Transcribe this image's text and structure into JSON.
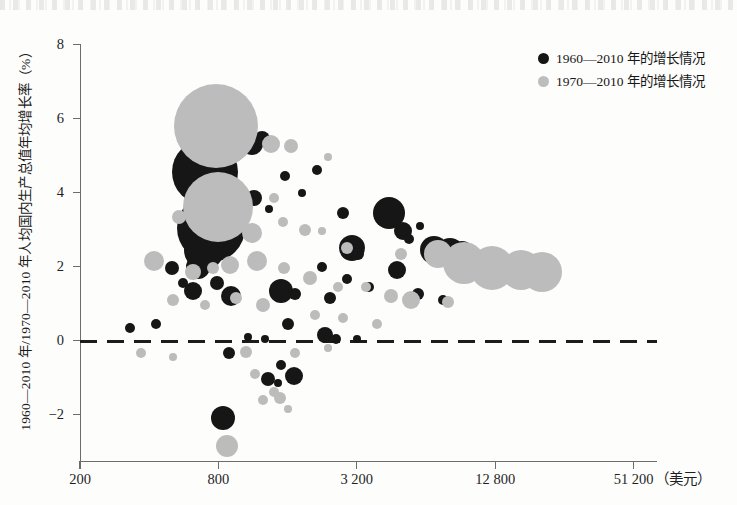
{
  "figure": {
    "width": 737,
    "height": 505,
    "background": "#fdfdfc"
  },
  "legend": {
    "position": "top-right",
    "items": [
      {
        "marker": "black-dot-icon",
        "color": "#151515",
        "label": "1960—2010 年的增长情况"
      },
      {
        "marker": "gray-dot-icon",
        "color": "#bdbdbd",
        "label": "1970—2010 年的增长情况"
      }
    ]
  },
  "axes": {
    "y_title": "1960—2010 年/1970—2010 年人均国内生产总值年均增长率（%）",
    "x_unit": "（美元）",
    "y_ticks": [
      "8",
      "6",
      "4",
      "2",
      "0",
      "-2"
    ],
    "x_ticks": [
      "200",
      "800",
      "3 200",
      "12 800",
      "51 200"
    ]
  },
  "chart_data": {
    "type": "scatter",
    "title": "",
    "subtitle": "",
    "xlabel": "人均国内生产总值（美元）",
    "ylabel": "1960—2010 年/1970—2010 年人均国内生产总值年均增长率（%）",
    "xscale": "log",
    "xlim": [
      200,
      51200
    ],
    "ylim": [
      -2.8,
      8.4
    ],
    "x_tick_values": [
      200,
      800,
      3200,
      12800,
      51200
    ],
    "x_tick_labels": [
      "200",
      "800",
      "3 200",
      "12 800",
      "51 200"
    ],
    "y_tick_values": [
      8,
      6,
      4,
      2,
      0,
      -2
    ],
    "y_tick_labels": [
      "8",
      "6",
      "4",
      "2",
      "0",
      "-2"
    ],
    "grid": false,
    "legend_position": "top right",
    "annotations": [
      {
        "type": "hline",
        "y": 0,
        "style": "dashed",
        "color": "#1c1c1c"
      }
    ],
    "marker_encoding": "bubble area proportional to economy size",
    "series": [
      {
        "name": "1960—2010 年的增长情况",
        "color": "#161616",
        "points": [
          {
            "x": 700,
            "y": 4.55,
            "r": 33
          },
          {
            "x": 745,
            "y": 3.05,
            "r": 34
          },
          {
            "x": 690,
            "y": 2.45,
            "r": 20
          },
          {
            "x": 655,
            "y": 2.0,
            "r": 12
          },
          {
            "x": 1120,
            "y": 5.3,
            "r": 11
          },
          {
            "x": 1240,
            "y": 5.45,
            "r": 8
          },
          {
            "x": 1560,
            "y": 4.45,
            "r": 5
          },
          {
            "x": 2150,
            "y": 4.6,
            "r": 5
          },
          {
            "x": 1850,
            "y": 4.0,
            "r": 4
          },
          {
            "x": 1140,
            "y": 3.85,
            "r": 8
          },
          {
            "x": 1030,
            "y": 3.45,
            "r": 4
          },
          {
            "x": 1330,
            "y": 3.55,
            "r": 4
          },
          {
            "x": 2800,
            "y": 3.45,
            "r": 6
          },
          {
            "x": 4400,
            "y": 3.45,
            "r": 16
          },
          {
            "x": 5100,
            "y": 2.95,
            "r": 9
          },
          {
            "x": 5400,
            "y": 2.75,
            "r": 5
          },
          {
            "x": 6000,
            "y": 3.1,
            "r": 4
          },
          {
            "x": 3050,
            "y": 2.5,
            "r": 13
          },
          {
            "x": 3250,
            "y": 2.35,
            "r": 6
          },
          {
            "x": 6900,
            "y": 2.45,
            "r": 14
          },
          {
            "x": 8100,
            "y": 2.4,
            "r": 14
          },
          {
            "x": 9200,
            "y": 2.35,
            "r": 13
          },
          {
            "x": 10500,
            "y": 2.2,
            "r": 10
          },
          {
            "x": 12000,
            "y": 2.05,
            "r": 8
          },
          {
            "x": 14000,
            "y": 1.95,
            "r": 7
          },
          {
            "x": 430,
            "y": 2.15,
            "r": 6
          },
          {
            "x": 505,
            "y": 1.95,
            "r": 7
          },
          {
            "x": 560,
            "y": 1.55,
            "r": 5
          },
          {
            "x": 620,
            "y": 1.35,
            "r": 9
          },
          {
            "x": 790,
            "y": 1.55,
            "r": 7
          },
          {
            "x": 905,
            "y": 1.2,
            "r": 10
          },
          {
            "x": 1500,
            "y": 1.35,
            "r": 12
          },
          {
            "x": 1720,
            "y": 1.25,
            "r": 6
          },
          {
            "x": 2250,
            "y": 2.0,
            "r": 5
          },
          {
            "x": 2450,
            "y": 1.15,
            "r": 6
          },
          {
            "x": 2900,
            "y": 1.65,
            "r": 5
          },
          {
            "x": 3600,
            "y": 1.45,
            "r": 5
          },
          {
            "x": 4800,
            "y": 1.9,
            "r": 9
          },
          {
            "x": 5900,
            "y": 1.25,
            "r": 6
          },
          {
            "x": 7600,
            "y": 1.1,
            "r": 5
          },
          {
            "x": 330,
            "y": 0.35,
            "r": 5
          },
          {
            "x": 430,
            "y": 0.45,
            "r": 5
          },
          {
            "x": 1080,
            "y": 0.1,
            "r": 4
          },
          {
            "x": 1280,
            "y": 0.05,
            "r": 4
          },
          {
            "x": 1600,
            "y": 0.45,
            "r": 6
          },
          {
            "x": 2320,
            "y": 0.15,
            "r": 8
          },
          {
            "x": 2600,
            "y": 0.05,
            "r": 5
          },
          {
            "x": 3200,
            "y": 0.05,
            "r": 4
          },
          {
            "x": 890,
            "y": -0.35,
            "r": 6
          },
          {
            "x": 1500,
            "y": -0.65,
            "r": 5
          },
          {
            "x": 1700,
            "y": -0.95,
            "r": 9
          },
          {
            "x": 1310,
            "y": -1.05,
            "r": 7
          },
          {
            "x": 1460,
            "y": -1.15,
            "r": 4
          },
          {
            "x": 840,
            "y": -2.1,
            "r": 12
          }
        ]
      },
      {
        "name": "1970—2010 年的增长情况",
        "color": "#bcbcbc",
        "points": [
          {
            "x": 780,
            "y": 5.8,
            "r": 42
          },
          {
            "x": 800,
            "y": 3.6,
            "r": 35
          },
          {
            "x": 1350,
            "y": 5.3,
            "r": 9
          },
          {
            "x": 1650,
            "y": 5.25,
            "r": 7
          },
          {
            "x": 2400,
            "y": 4.95,
            "r": 4
          },
          {
            "x": 1020,
            "y": 4.0,
            "r": 6
          },
          {
            "x": 1400,
            "y": 3.85,
            "r": 5
          },
          {
            "x": 540,
            "y": 3.35,
            "r": 7
          },
          {
            "x": 1120,
            "y": 2.9,
            "r": 10
          },
          {
            "x": 1530,
            "y": 3.2,
            "r": 5
          },
          {
            "x": 1900,
            "y": 3.0,
            "r": 6
          },
          {
            "x": 2250,
            "y": 2.95,
            "r": 4
          },
          {
            "x": 2900,
            "y": 2.5,
            "r": 6
          },
          {
            "x": 5000,
            "y": 2.35,
            "r": 6
          },
          {
            "x": 7200,
            "y": 2.35,
            "r": 14
          },
          {
            "x": 9400,
            "y": 2.1,
            "r": 21
          },
          {
            "x": 12400,
            "y": 1.95,
            "r": 22
          },
          {
            "x": 16500,
            "y": 1.9,
            "r": 20
          },
          {
            "x": 20500,
            "y": 1.85,
            "r": 20
          },
          {
            "x": 420,
            "y": 2.15,
            "r": 10
          },
          {
            "x": 620,
            "y": 1.85,
            "r": 8
          },
          {
            "x": 760,
            "y": 1.95,
            "r": 6
          },
          {
            "x": 900,
            "y": 2.05,
            "r": 9
          },
          {
            "x": 1180,
            "y": 2.15,
            "r": 10
          },
          {
            "x": 1550,
            "y": 1.95,
            "r": 6
          },
          {
            "x": 2000,
            "y": 1.7,
            "r": 7
          },
          {
            "x": 2650,
            "y": 1.45,
            "r": 5
          },
          {
            "x": 3500,
            "y": 1.45,
            "r": 5
          },
          {
            "x": 4500,
            "y": 1.2,
            "r": 7
          },
          {
            "x": 5500,
            "y": 1.1,
            "r": 9
          },
          {
            "x": 8000,
            "y": 1.05,
            "r": 6
          },
          {
            "x": 510,
            "y": 1.1,
            "r": 6
          },
          {
            "x": 700,
            "y": 0.95,
            "r": 5
          },
          {
            "x": 950,
            "y": 1.15,
            "r": 6
          },
          {
            "x": 1250,
            "y": 0.95,
            "r": 7
          },
          {
            "x": 2100,
            "y": 0.7,
            "r": 5
          },
          {
            "x": 2800,
            "y": 0.6,
            "r": 5
          },
          {
            "x": 3900,
            "y": 0.45,
            "r": 5
          },
          {
            "x": 370,
            "y": -0.35,
            "r": 5
          },
          {
            "x": 510,
            "y": -0.45,
            "r": 4
          },
          {
            "x": 1060,
            "y": -0.3,
            "r": 6
          },
          {
            "x": 1720,
            "y": -0.35,
            "r": 5
          },
          {
            "x": 2400,
            "y": -0.2,
            "r": 4
          },
          {
            "x": 1150,
            "y": -0.9,
            "r": 5
          },
          {
            "x": 1400,
            "y": -1.4,
            "r": 5
          },
          {
            "x": 1480,
            "y": -1.55,
            "r": 6
          },
          {
            "x": 1250,
            "y": -1.6,
            "r": 5
          },
          {
            "x": 1600,
            "y": -1.85,
            "r": 4
          },
          {
            "x": 870,
            "y": -2.85,
            "r": 11
          }
        ]
      }
    ]
  }
}
